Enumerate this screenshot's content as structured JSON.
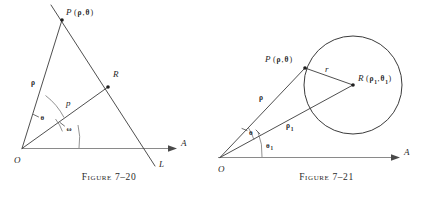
{
  "page": {
    "kind": "textbook-figure-pair",
    "background_color": "#ffffff",
    "ink_color": "#1f1f1f",
    "axis_color": "#8a8a8a"
  },
  "figures": [
    {
      "id": "figure-7-20",
      "caption": "Figure 7–20",
      "description": "Polar normal form of a straight line L, with foot of perpendicular R and point P on L.",
      "points": [
        {
          "name": "O",
          "label": "O",
          "kind": "origin"
        },
        {
          "name": "P",
          "label": "P",
          "kind": "point-on-line",
          "args": "(ρ,θ)"
        },
        {
          "name": "R",
          "label": "R",
          "kind": "foot-of-perpendicular"
        }
      ],
      "labels": {
        "origin": "O",
        "point_P": "P",
        "point_P_args_open": "(",
        "point_P_rho": "ρ",
        "point_P_comma": ",",
        "point_P_theta": "θ",
        "point_P_args_close": ")",
        "point_R": "R",
        "segment_rho": "ρ",
        "segment_p": "p",
        "angle_theta": "θ",
        "angle_omega": "ω",
        "axis_A": "A",
        "line_L": "L"
      }
    },
    {
      "id": "figure-7-21",
      "caption": "Figure 7–21",
      "description": "Polar equation of a circle of radius r with center R at polar coordinates (rho-one, theta-one), and a point P on the circle.",
      "points": [
        {
          "name": "O",
          "label": "O",
          "kind": "origin"
        },
        {
          "name": "P",
          "label": "P",
          "kind": "point-on-circle",
          "args": "(ρ,θ)"
        },
        {
          "name": "R",
          "label": "R",
          "kind": "circle-center",
          "args": "(ρ₁,θ₁)"
        }
      ],
      "labels": {
        "origin": "O",
        "point_P": "P",
        "point_P_args_open": "(",
        "point_P_rho": "ρ",
        "point_P_comma": ",",
        "point_P_theta": "θ",
        "point_P_args_close": ")",
        "point_R": "R",
        "point_R_args_open": "(",
        "point_R_rho1": "ρ",
        "point_R_rho1_sub": "1",
        "point_R_comma": ",",
        "point_R_theta1": "θ",
        "point_R_theta1_sub": "1",
        "point_R_args_close": ")",
        "segment_rho": "ρ",
        "segment_rho1": "ρ",
        "segment_rho1_sub": "1",
        "segment_r": "r",
        "angle_theta": "θ",
        "angle_theta1": "θ",
        "angle_theta1_sub": "1",
        "axis_A": "A"
      }
    }
  ]
}
